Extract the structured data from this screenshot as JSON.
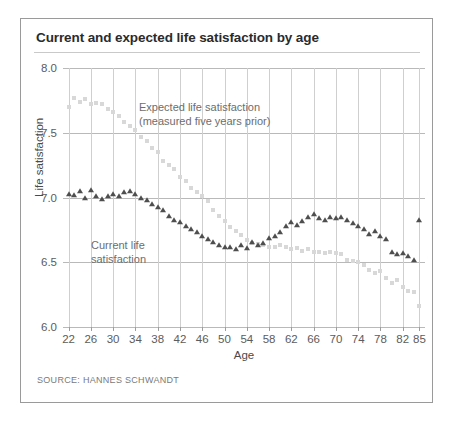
{
  "figure": {
    "title": "Current and expected life satisfaction by age",
    "source": "SOURCE: HANNES SCHWANDT"
  },
  "annotations": {
    "expected_line1": "Expected life satisfaction",
    "expected_line2": "(measured five years prior)",
    "current_line1": "Current life",
    "current_line2": "satisfaction"
  },
  "colors": {
    "title": "#2b2b2b",
    "expected_marker": "#d8d8d8",
    "current_marker": "#4e4e4e",
    "grid": "#cfcfcf",
    "border": "#9a9a9a"
  },
  "chart_data": {
    "type": "scatter",
    "title": "Current and expected life satisfaction by age",
    "xlabel": "Age",
    "ylabel": "Life satisfaction",
    "xlim": [
      21,
      86
    ],
    "ylim": [
      6.0,
      8.0
    ],
    "yticks": [
      "6.0",
      "6.5",
      "7.0",
      "7.5",
      "8.0"
    ],
    "ytick_values": [
      6.0,
      6.5,
      7.0,
      7.5,
      8.0
    ],
    "xticks": [
      "22",
      "26",
      "30",
      "34",
      "38",
      "42",
      "46",
      "50",
      "54",
      "58",
      "62",
      "66",
      "70",
      "74",
      "78",
      "82",
      "85"
    ],
    "xtick_values": [
      22,
      26,
      30,
      34,
      38,
      42,
      46,
      50,
      54,
      58,
      62,
      66,
      70,
      74,
      78,
      82,
      85
    ],
    "grid": true,
    "legend_position": "inline-annotations",
    "series": [
      {
        "name": "Expected life satisfaction (measured five years prior)",
        "marker": "square",
        "color": "#d8d8d8",
        "x": [
          22,
          23,
          24,
          25,
          26,
          27,
          28,
          29,
          30,
          31,
          32,
          33,
          34,
          35,
          36,
          37,
          38,
          39,
          40,
          41,
          42,
          43,
          44,
          45,
          46,
          47,
          48,
          49,
          50,
          51,
          52,
          53,
          54,
          55,
          56,
          57,
          58,
          59,
          60,
          61,
          62,
          63,
          64,
          65,
          66,
          67,
          68,
          69,
          70,
          71,
          72,
          73,
          74,
          75,
          76,
          77,
          78,
          79,
          80,
          81,
          82,
          83,
          84,
          85
        ],
        "y": [
          7.7,
          7.77,
          7.74,
          7.76,
          7.72,
          7.73,
          7.72,
          7.68,
          7.66,
          7.63,
          7.58,
          7.55,
          7.52,
          7.47,
          7.44,
          7.38,
          7.35,
          7.28,
          7.25,
          7.22,
          7.16,
          7.13,
          7.07,
          7.04,
          7.01,
          6.97,
          6.9,
          6.86,
          6.82,
          6.77,
          6.74,
          6.71,
          6.67,
          6.65,
          6.64,
          6.63,
          6.62,
          6.62,
          6.63,
          6.62,
          6.6,
          6.61,
          6.59,
          6.6,
          6.58,
          6.58,
          6.57,
          6.58,
          6.57,
          6.56,
          6.52,
          6.51,
          6.5,
          6.48,
          6.44,
          6.42,
          6.43,
          6.38,
          6.34,
          6.36,
          6.31,
          6.28,
          6.27,
          6.16
        ]
      },
      {
        "name": "Current life satisfaction",
        "marker": "triangle",
        "color": "#4e4e4e",
        "x": [
          22,
          23,
          24,
          25,
          26,
          27,
          28,
          29,
          30,
          31,
          32,
          33,
          34,
          35,
          36,
          37,
          38,
          39,
          40,
          41,
          42,
          43,
          44,
          45,
          46,
          47,
          48,
          49,
          50,
          51,
          52,
          53,
          54,
          55,
          56,
          57,
          58,
          59,
          60,
          61,
          62,
          63,
          64,
          65,
          66,
          67,
          68,
          69,
          70,
          71,
          72,
          73,
          74,
          75,
          76,
          77,
          78,
          79,
          80,
          81,
          82,
          83,
          84,
          85
        ],
        "y": [
          7.03,
          7.02,
          7.05,
          7.0,
          7.06,
          7.01,
          6.99,
          7.01,
          7.03,
          7.01,
          7.04,
          7.05,
          7.03,
          7.0,
          6.98,
          6.95,
          6.93,
          6.9,
          6.86,
          6.83,
          6.81,
          6.78,
          6.76,
          6.73,
          6.7,
          6.68,
          6.66,
          6.63,
          6.62,
          6.62,
          6.6,
          6.63,
          6.61,
          6.66,
          6.63,
          6.65,
          6.69,
          6.7,
          6.73,
          6.78,
          6.81,
          6.79,
          6.82,
          6.85,
          6.87,
          6.84,
          6.83,
          6.85,
          6.84,
          6.85,
          6.83,
          6.8,
          6.78,
          6.76,
          6.72,
          6.74,
          6.7,
          6.68,
          6.58,
          6.56,
          6.57,
          6.55,
          6.52,
          6.83
        ]
      }
    ]
  }
}
